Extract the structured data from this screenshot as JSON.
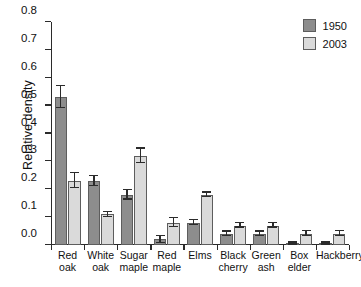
{
  "chart_data": {
    "type": "bar",
    "title": "",
    "xlabel": "",
    "ylabel": "Relative density",
    "ylim": [
      0.0,
      0.8
    ],
    "ytick_labels": [
      "0.0",
      "0.1",
      "0.2",
      "0.3",
      "0.4",
      "0.5",
      "0.6",
      "0.7",
      "0.8"
    ],
    "ytick_values": [
      0.0,
      0.1,
      0.2,
      0.3,
      0.4,
      0.5,
      0.6,
      0.7,
      0.8
    ],
    "grid": false,
    "legend_position": "top-right",
    "categories": [
      "Red oak",
      "White oak",
      "Sugar maple",
      "Red maple",
      "Elms",
      "Black cherry",
      "Green ash",
      "Box elder",
      "Hackberry"
    ],
    "category_lines": [
      [
        "Red",
        "oak"
      ],
      [
        "White",
        "oak"
      ],
      [
        "Sugar",
        "maple"
      ],
      [
        "Red",
        "maple"
      ],
      [
        "Elms"
      ],
      [
        "Black",
        "cherry"
      ],
      [
        "Green",
        "ash"
      ],
      [
        "Box",
        "elder"
      ],
      [
        "Hackberry"
      ]
    ],
    "series": [
      {
        "name": "1950",
        "color": "#8d8d8d",
        "values": [
          0.53,
          0.23,
          0.18,
          0.02,
          0.08,
          0.04,
          0.04,
          0.005,
          0.005
        ],
        "errors": [
          0.04,
          0.018,
          0.017,
          0.013,
          0.008,
          0.008,
          0.008,
          0.004,
          0.004
        ]
      },
      {
        "name": "2003",
        "color": "#dadada",
        "values": [
          0.23,
          0.11,
          0.32,
          0.08,
          0.18,
          0.07,
          0.07,
          0.04,
          0.04
        ],
        "errors": [
          0.027,
          0.009,
          0.026,
          0.017,
          0.008,
          0.008,
          0.008,
          0.009,
          0.009
        ]
      }
    ]
  },
  "legend": {
    "entries": [
      {
        "label": "1950"
      },
      {
        "label": "2003"
      }
    ]
  }
}
